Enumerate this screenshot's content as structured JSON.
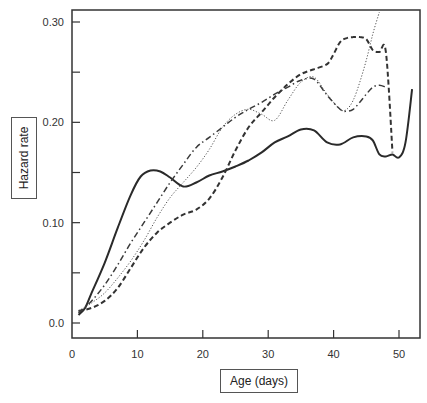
{
  "chart_data": {
    "type": "line",
    "title": "",
    "xlabel": "Age (days)",
    "ylabel": "Hazard rate",
    "xlim": [
      0,
      53
    ],
    "ylim": [
      -0.015,
      0.313
    ],
    "x_ticks": [
      0,
      10,
      20,
      30,
      40,
      50
    ],
    "x_tick_labels": [
      "0",
      "10",
      "20",
      "30",
      "40",
      "50"
    ],
    "y_ticks": [
      0.0,
      0.05,
      0.1,
      0.15,
      0.2,
      0.25,
      0.3
    ],
    "y_tick_labels": [
      "0.0",
      "",
      "0.10",
      "",
      "0.20",
      "",
      "0.30"
    ],
    "grid": false,
    "legend": "none",
    "series": [
      {
        "name": "solid",
        "style": "solid",
        "width": 2,
        "x": [
          1,
          2,
          3,
          5,
          7,
          9,
          10.5,
          12,
          13.5,
          15,
          17,
          19,
          21,
          23,
          25,
          27,
          29,
          31,
          33,
          35,
          37,
          39,
          41,
          43,
          45,
          46,
          47,
          48,
          49,
          50,
          51,
          52
        ],
        "y": [
          0.008,
          0.015,
          0.03,
          0.06,
          0.095,
          0.128,
          0.146,
          0.152,
          0.151,
          0.145,
          0.136,
          0.14,
          0.147,
          0.151,
          0.156,
          0.162,
          0.17,
          0.18,
          0.186,
          0.193,
          0.192,
          0.18,
          0.178,
          0.185,
          0.186,
          0.182,
          0.168,
          0.166,
          0.168,
          0.165,
          0.18,
          0.233
        ]
      },
      {
        "name": "dashed",
        "style": "dashed",
        "width": 2,
        "x": [
          1,
          3,
          5,
          7,
          9,
          11,
          13,
          15,
          17,
          19,
          21,
          23,
          25,
          27,
          29,
          31,
          33,
          35,
          37,
          39,
          40,
          41,
          42,
          43,
          44,
          45,
          46,
          47,
          48,
          49
        ],
        "y": [
          0.012,
          0.015,
          0.022,
          0.035,
          0.055,
          0.075,
          0.09,
          0.1,
          0.108,
          0.113,
          0.124,
          0.145,
          0.172,
          0.195,
          0.21,
          0.225,
          0.238,
          0.248,
          0.253,
          0.258,
          0.268,
          0.28,
          0.284,
          0.285,
          0.285,
          0.283,
          0.272,
          0.27,
          0.27,
          0.17
        ]
      },
      {
        "name": "dotted",
        "style": "dotted",
        "width": 1,
        "x": [
          1,
          3,
          5,
          7,
          9,
          11,
          13,
          15,
          17,
          19,
          21,
          23,
          25,
          27,
          29,
          31,
          33,
          35,
          37,
          39,
          41,
          42,
          43,
          44,
          45,
          46,
          47
        ],
        "y": [
          0.012,
          0.02,
          0.03,
          0.045,
          0.062,
          0.082,
          0.105,
          0.125,
          0.14,
          0.155,
          0.173,
          0.195,
          0.208,
          0.213,
          0.208,
          0.202,
          0.222,
          0.24,
          0.245,
          0.228,
          0.213,
          0.213,
          0.222,
          0.24,
          0.262,
          0.288,
          0.31
        ]
      },
      {
        "name": "dash-dot",
        "style": "dashdot",
        "width": 1.5,
        "x": [
          1,
          3,
          5,
          7,
          9,
          11,
          13,
          15,
          17,
          19,
          21,
          23,
          25,
          27,
          29,
          31,
          33,
          35,
          37,
          39,
          41,
          42,
          43,
          44,
          45,
          46,
          47,
          48
        ],
        "y": [
          0.01,
          0.022,
          0.038,
          0.058,
          0.08,
          0.1,
          0.12,
          0.14,
          0.158,
          0.175,
          0.185,
          0.195,
          0.205,
          0.213,
          0.22,
          0.228,
          0.235,
          0.242,
          0.243,
          0.227,
          0.213,
          0.211,
          0.213,
          0.22,
          0.228,
          0.235,
          0.237,
          0.235
        ]
      }
    ]
  },
  "labels": {
    "ylabel": "Hazard rate",
    "xlabel": "Age (days)"
  }
}
